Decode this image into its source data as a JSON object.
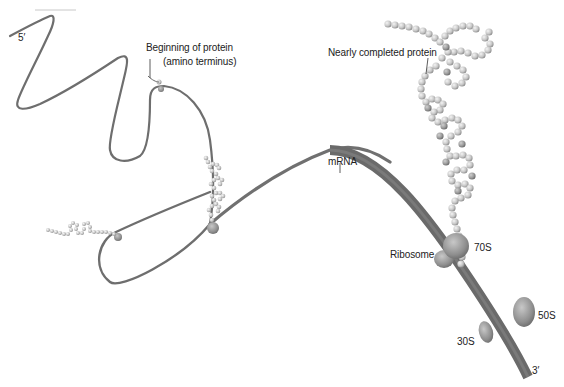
{
  "figure": {
    "labels": {
      "five_prime": "5′",
      "three_prime": "3′",
      "beginning_protein_line1": "Beginning of protein",
      "beginning_protein_line2": "(amino terminus)",
      "nearly_completed": "Nearly completed protein",
      "mrna": "mRNA",
      "ribosome": "Ribosome",
      "s70": "70S",
      "s50": "50S",
      "s30": "30S"
    },
    "colors": {
      "mrna_strand": "#6e6e6e",
      "ribosome": "#8a8a8a",
      "bead_light": "#d8d8d8",
      "bead_dark": "#8c8c8c",
      "text": "#222222"
    }
  }
}
